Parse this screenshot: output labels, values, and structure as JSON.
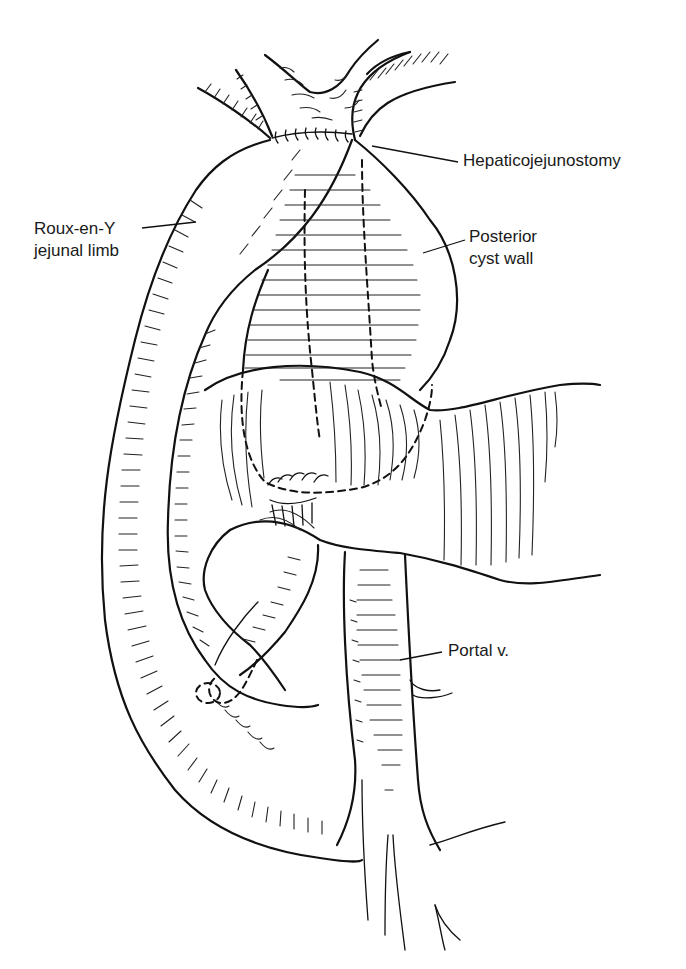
{
  "figure": {
    "type": "surgical anatomical line illustration",
    "labels": [
      {
        "id": "hepaticojejunostomy",
        "text": "Hepaticojejunostomy"
      },
      {
        "id": "roux-limb",
        "lines": [
          "Roux-en-Y",
          "jejunal limb"
        ]
      },
      {
        "id": "posterior-cyst-wall",
        "lines": [
          "Posterior",
          "cyst wall"
        ]
      },
      {
        "id": "portal-vein",
        "text": "Portal v."
      }
    ],
    "colors": {
      "background": "#ffffff",
      "ink": "#111111",
      "label_text": "#1a1a1a"
    }
  }
}
